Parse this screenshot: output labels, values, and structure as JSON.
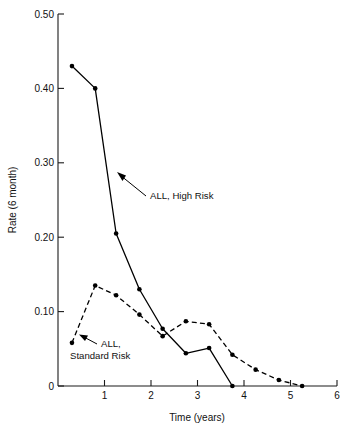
{
  "chart_data": {
    "type": "line",
    "title": "",
    "subtitle": "",
    "xlabel": "Time (years)",
    "ylabel": "Rate (6 month)",
    "xlim": [
      0,
      6
    ],
    "ylim": [
      0,
      0.5
    ],
    "grid": false,
    "legend_position": "inline-annotations",
    "x_ticks": [
      0,
      1,
      2,
      3,
      4,
      5,
      6
    ],
    "x_tick_labels": [
      "",
      "1",
      "2",
      "3",
      "4",
      "5",
      "6"
    ],
    "y_ticks": [
      0,
      0.1,
      0.2,
      0.3,
      0.4,
      0.5
    ],
    "y_tick_labels": [
      "0",
      "0.10",
      "0.20",
      "0.30",
      "0.40",
      "0.50"
    ],
    "series": [
      {
        "name": "ALL, High Risk",
        "style": "solid",
        "marker": "filled-circle",
        "x": [
          0.3,
          0.8,
          1.25,
          1.75,
          2.25,
          2.75,
          3.25,
          3.75
        ],
        "values": [
          0.43,
          0.4,
          0.205,
          0.13,
          0.077,
          0.044,
          0.051,
          0.0
        ]
      },
      {
        "name": "ALL, Standard Risk",
        "style": "dashed",
        "marker": "filled-circle",
        "x": [
          0.3,
          0.8,
          1.25,
          1.75,
          2.25,
          2.75,
          3.25,
          3.75,
          4.25,
          4.75,
          5.25
        ],
        "values": [
          0.058,
          0.135,
          0.122,
          0.096,
          0.067,
          0.087,
          0.083,
          0.042,
          0.022,
          0.008,
          0.0
        ]
      }
    ],
    "annotations": [
      {
        "id": "high-risk",
        "text": "ALL, High Risk",
        "lines": [
          "ALL, High Risk"
        ],
        "points_to_series": "ALL, High Risk"
      },
      {
        "id": "standard-risk",
        "text": "ALL, Standard Risk",
        "lines": [
          "ALL,",
          "Standard Risk"
        ],
        "points_to_series": "ALL, Standard Risk"
      }
    ],
    "colors": {
      "ink": "#000000",
      "background": "#ffffff"
    }
  }
}
